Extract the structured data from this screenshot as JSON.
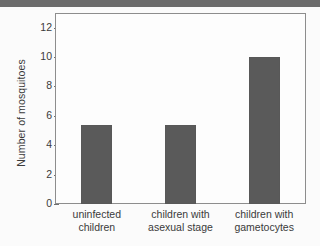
{
  "chart_data": {
    "type": "bar",
    "title": "",
    "xlabel": "",
    "ylabel": "Number of mosquitoes",
    "categories": [
      "uninfected children",
      "children with asexual stage",
      "children with gametocytes"
    ],
    "category_lines": [
      [
        "uninfected",
        "children"
      ],
      [
        "children with",
        "asexual stage"
      ],
      [
        "children with",
        "gametocytes"
      ]
    ],
    "values": [
      5.4,
      5.4,
      10.0
    ],
    "ylim": [
      0,
      13
    ],
    "yticks": [
      0,
      2,
      4,
      6,
      8,
      10,
      12
    ],
    "ytick_labels": [
      "0",
      "2",
      "4",
      "6",
      "8",
      "10",
      "12"
    ],
    "grid": false,
    "legend": null,
    "bar_color": "#5a5a5a",
    "frame_color": "#8d8d8d",
    "plot_background": "#fdfdfd",
    "page_background": "#fbfbfb",
    "band_color": "#6c6c6c"
  }
}
